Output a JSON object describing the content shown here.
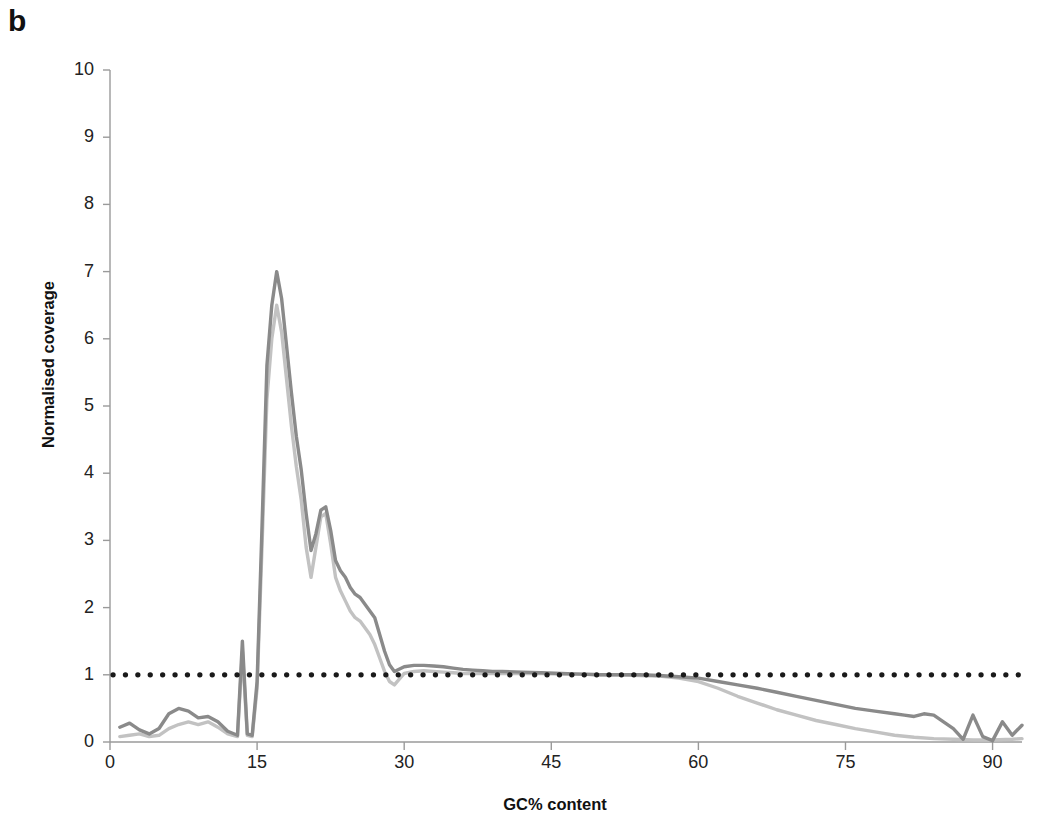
{
  "figure": {
    "panel_label": "b"
  },
  "chart_data": {
    "type": "line",
    "title": "",
    "xlabel": "GC% content",
    "ylabel": "Normalised coverage",
    "xlim": [
      0,
      93
    ],
    "ylim": [
      0,
      10
    ],
    "xticks": [
      0,
      15,
      30,
      45,
      60,
      75,
      90
    ],
    "xtick_labels": [
      "0",
      "15",
      "30",
      "45",
      "60",
      "75",
      "90"
    ],
    "yticks": [
      0,
      1,
      2,
      3,
      4,
      5,
      6,
      7,
      8,
      9,
      10
    ],
    "ytick_labels": [
      "0",
      "1",
      "2",
      "3",
      "4",
      "5",
      "6",
      "7",
      "8",
      "9",
      "10"
    ],
    "grid": false,
    "legend": "none",
    "reference_line": {
      "name": "expected-coverage",
      "y": 1,
      "style": "dotted",
      "color": "#1a1a1a"
    },
    "series": [
      {
        "name": "sample-dark",
        "color": "#8a8a8a",
        "x": [
          1,
          2,
          3,
          4,
          5,
          6,
          7,
          8,
          9,
          10,
          11,
          12,
          13,
          13.5,
          14,
          14.5,
          15,
          15.5,
          16,
          16.5,
          17,
          17.5,
          18,
          18.5,
          19,
          19.5,
          20,
          20.5,
          21,
          21.5,
          22,
          22.5,
          23,
          23.5,
          24,
          24.5,
          25,
          25.5,
          26,
          26.5,
          27,
          27.5,
          28,
          28.5,
          29,
          30,
          31,
          32,
          33,
          34,
          35,
          36,
          37,
          38,
          39,
          40,
          42,
          44,
          46,
          48,
          50,
          52,
          54,
          56,
          58,
          60,
          62,
          64,
          66,
          68,
          70,
          72,
          74,
          76,
          78,
          80,
          81,
          82,
          83,
          84,
          85,
          86,
          87,
          88,
          89,
          90,
          91,
          92,
          93
        ],
        "y": [
          0.22,
          0.28,
          0.18,
          0.12,
          0.2,
          0.42,
          0.5,
          0.46,
          0.36,
          0.38,
          0.3,
          0.16,
          0.1,
          1.5,
          0.12,
          0.1,
          0.9,
          3.2,
          5.6,
          6.5,
          7.0,
          6.6,
          5.9,
          5.2,
          4.55,
          4.05,
          3.4,
          2.85,
          3.1,
          3.45,
          3.5,
          3.15,
          2.7,
          2.55,
          2.45,
          2.3,
          2.2,
          2.15,
          2.05,
          1.95,
          1.85,
          1.6,
          1.35,
          1.15,
          1.05,
          1.12,
          1.14,
          1.14,
          1.13,
          1.12,
          1.1,
          1.08,
          1.07,
          1.06,
          1.05,
          1.05,
          1.04,
          1.03,
          1.02,
          1.01,
          1.0,
          1.0,
          1.0,
          0.99,
          0.97,
          0.95,
          0.9,
          0.85,
          0.8,
          0.74,
          0.68,
          0.62,
          0.56,
          0.5,
          0.46,
          0.42,
          0.4,
          0.38,
          0.42,
          0.4,
          0.3,
          0.2,
          0.04,
          0.4,
          0.08,
          0.02,
          0.3,
          0.1,
          0.25
        ]
      },
      {
        "name": "sample-light",
        "color": "#c2c2c2",
        "x": [
          1,
          2,
          3,
          4,
          5,
          6,
          7,
          8,
          9,
          10,
          11,
          12,
          13,
          13.5,
          14,
          14.5,
          15,
          15.5,
          16,
          16.5,
          17,
          17.5,
          18,
          18.5,
          19,
          19.5,
          20,
          20.5,
          21,
          21.5,
          22,
          22.5,
          23,
          23.5,
          24,
          24.5,
          25,
          25.5,
          26,
          26.5,
          27,
          27.5,
          28,
          28.5,
          29,
          30,
          31,
          32,
          33,
          34,
          35,
          36,
          37,
          38,
          39,
          40,
          42,
          44,
          46,
          48,
          50,
          52,
          54,
          56,
          58,
          60,
          62,
          64,
          66,
          68,
          70,
          72,
          74,
          76,
          78,
          80,
          82,
          84,
          86,
          88,
          90,
          92,
          93
        ],
        "y": [
          0.08,
          0.1,
          0.12,
          0.08,
          0.1,
          0.2,
          0.26,
          0.3,
          0.26,
          0.3,
          0.22,
          0.12,
          0.08,
          1.35,
          0.1,
          0.08,
          0.8,
          2.9,
          5.1,
          6.0,
          6.5,
          6.1,
          5.4,
          4.7,
          4.1,
          3.6,
          2.9,
          2.45,
          2.9,
          3.35,
          3.4,
          2.95,
          2.45,
          2.25,
          2.1,
          1.95,
          1.85,
          1.8,
          1.7,
          1.6,
          1.45,
          1.25,
          1.05,
          0.9,
          0.85,
          1.02,
          1.05,
          1.06,
          1.05,
          1.04,
          1.03,
          1.02,
          1.02,
          1.02,
          1.02,
          1.02,
          1.02,
          1.02,
          1.01,
          1.01,
          1.0,
          1.0,
          0.99,
          0.98,
          0.95,
          0.9,
          0.8,
          0.68,
          0.58,
          0.48,
          0.4,
          0.32,
          0.26,
          0.2,
          0.15,
          0.1,
          0.07,
          0.05,
          0.04,
          0.03,
          0.03,
          0.04,
          0.05
        ]
      }
    ],
    "annotations": [
      {
        "name": "peak-marker",
        "x": 17,
        "y": 7.0,
        "text": ""
      }
    ]
  }
}
